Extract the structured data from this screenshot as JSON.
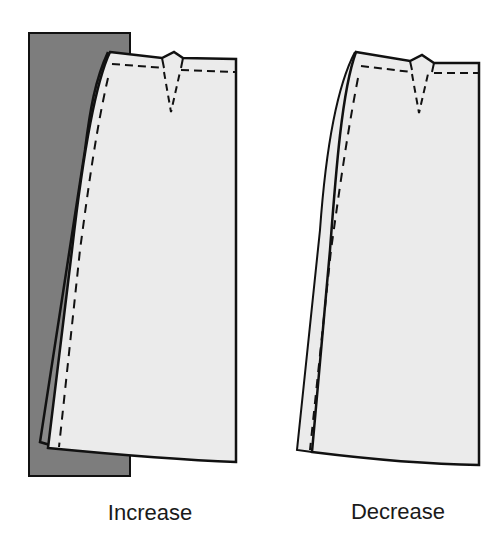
{
  "diagram": {
    "type": "skirt pattern adjustment",
    "colors": {
      "background": "#ffffff",
      "pattern_fill": "#ebebeb",
      "underlay_fill": "#7d7d7d",
      "line": "#111111"
    },
    "panels": [
      {
        "id": "increase",
        "label": "Increase",
        "has_underlay": true
      },
      {
        "id": "decrease",
        "label": "Decrease",
        "has_underlay": false
      }
    ]
  }
}
